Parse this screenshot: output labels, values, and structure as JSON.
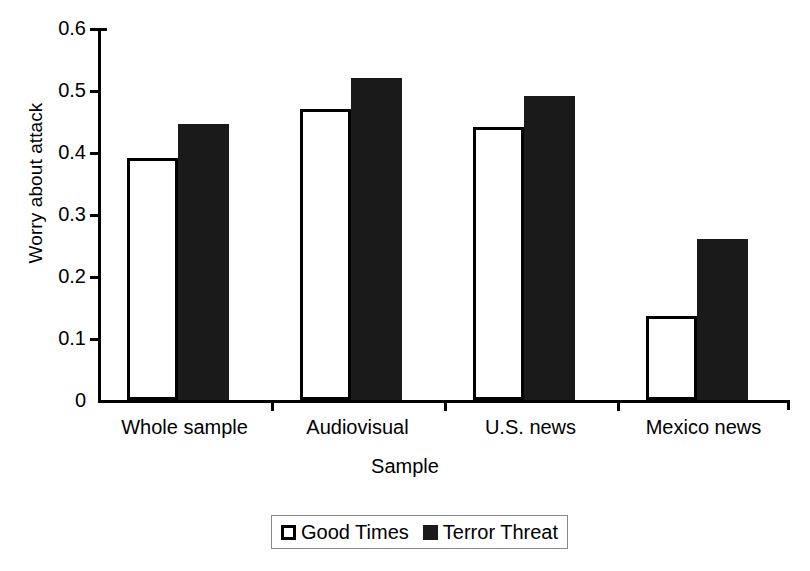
{
  "chart_data": {
    "type": "bar",
    "title": "",
    "xlabel": "Sample",
    "ylabel": "Worry about attack",
    "categories": [
      "Whole sample",
      "Audiovisual",
      "U.S. news",
      "Mexico news"
    ],
    "series": [
      {
        "name": "Good Times",
        "color": "#ffffff",
        "values": [
          0.39,
          0.47,
          0.44,
          0.135
        ]
      },
      {
        "name": "Terror Threat",
        "color": "#1a1a1a",
        "values": [
          0.445,
          0.52,
          0.49,
          0.26
        ]
      }
    ],
    "ylim": [
      0,
      0.6
    ],
    "ytick_labels": [
      "0",
      "0.1",
      "0.2",
      "0.3",
      "0.4",
      "0.5",
      "0.6"
    ],
    "ytick_values": [
      0,
      0.1,
      0.2,
      0.3,
      0.4,
      0.5,
      0.6
    ],
    "grid": false,
    "legend_position": "bottom-center"
  }
}
